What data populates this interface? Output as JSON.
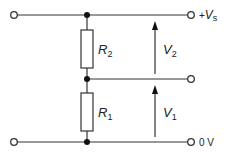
{
  "diagram": {
    "type": "potential-divider-circuit",
    "components": {
      "r2": {
        "symbol": "R",
        "subscript": "2"
      },
      "r1": {
        "symbol": "R",
        "subscript": "1"
      }
    },
    "voltages": {
      "v2": {
        "symbol": "V",
        "subscript": "2"
      },
      "v1": {
        "symbol": "V",
        "subscript": "1"
      }
    },
    "rails": {
      "top": {
        "prefix": "+",
        "symbol": "V",
        "subscript": "s"
      },
      "bottom": {
        "label": "0 V"
      }
    }
  }
}
